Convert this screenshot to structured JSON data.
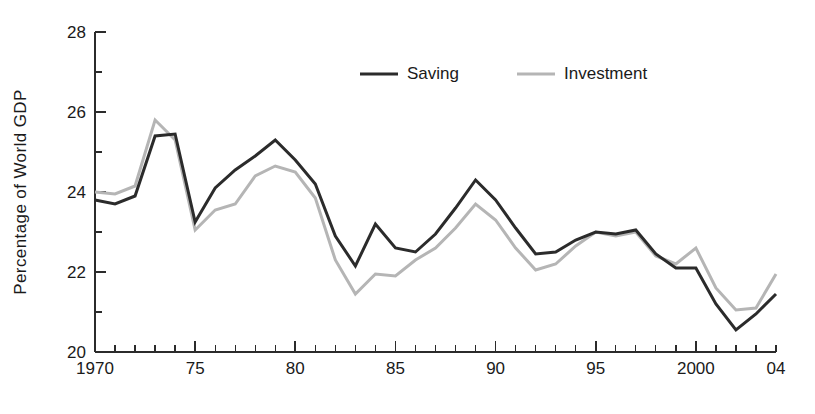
{
  "chart_data": {
    "type": "line",
    "title": "",
    "subtitle": "",
    "xlabel": "",
    "ylabel": "Percentage of World GDP",
    "xlim": [
      1970,
      2004
    ],
    "ylim": [
      20,
      28
    ],
    "y_major_ticks": [
      20,
      22,
      24,
      26,
      28
    ],
    "y_minor_step": 1,
    "x_major_ticks": [
      1970,
      1975,
      1980,
      1985,
      1990,
      1995,
      2000,
      2004
    ],
    "x_tick_labels": [
      "1970",
      "75",
      "80",
      "85",
      "90",
      "95",
      "2000",
      "04"
    ],
    "x_minor_step": 1,
    "grid": false,
    "legend_position": "top-center",
    "x": [
      1970,
      1971,
      1972,
      1973,
      1974,
      1975,
      1976,
      1977,
      1978,
      1979,
      1980,
      1981,
      1982,
      1983,
      1984,
      1985,
      1986,
      1987,
      1988,
      1989,
      1990,
      1991,
      1992,
      1993,
      1994,
      1995,
      1996,
      1997,
      1998,
      1999,
      2000,
      2001,
      2002,
      2003,
      2004
    ],
    "series": [
      {
        "name": "Saving",
        "color": "#2b2b2b",
        "width": 3.0,
        "values": [
          23.8,
          23.7,
          23.9,
          25.4,
          25.45,
          23.25,
          24.1,
          24.55,
          24.9,
          25.3,
          24.8,
          24.2,
          22.9,
          22.15,
          23.2,
          22.6,
          22.5,
          22.95,
          23.6,
          24.3,
          23.8,
          23.1,
          22.45,
          22.5,
          22.8,
          23.0,
          22.95,
          23.05,
          22.45,
          22.1,
          22.1,
          21.2,
          20.55,
          20.95,
          21.45
        ]
      },
      {
        "name": "Investment",
        "color": "#b5b5b5",
        "width": 3.0,
        "values": [
          24.0,
          23.95,
          24.15,
          25.8,
          25.3,
          23.05,
          23.55,
          23.7,
          24.4,
          24.65,
          24.5,
          23.85,
          22.3,
          21.45,
          21.95,
          21.9,
          22.3,
          22.6,
          23.1,
          23.7,
          23.3,
          22.6,
          22.05,
          22.2,
          22.65,
          23.0,
          22.9,
          23.0,
          22.4,
          22.2,
          22.6,
          21.6,
          21.05,
          21.1,
          21.95
        ]
      }
    ],
    "legend": [
      {
        "label": "Saving",
        "color": "#2b2b2b"
      },
      {
        "label": "Investment",
        "color": "#b5b5b5"
      }
    ]
  }
}
